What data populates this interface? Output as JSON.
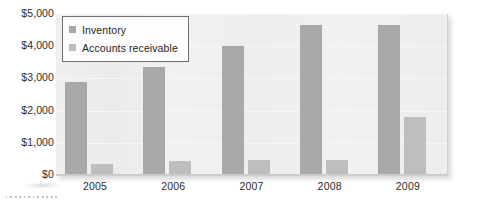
{
  "chart_data": {
    "type": "bar",
    "title": "",
    "xlabel": "",
    "ylabel": "",
    "categories": [
      "2005",
      "2006",
      "2007",
      "2008",
      "2009"
    ],
    "series": [
      {
        "name": "Inventory",
        "color": "#a8a8a8",
        "values": [
          2900,
          3350,
          4000,
          4650,
          4650
        ]
      },
      {
        "name": "Accounts receivable",
        "color": "#bebebe",
        "values": [
          350,
          430,
          480,
          470,
          1800
        ]
      }
    ],
    "ylim": [
      0,
      5000
    ],
    "yticks": [
      0,
      1000,
      2000,
      3000,
      4000,
      5000
    ],
    "ytick_labels": [
      "$0",
      "$1,000",
      "$2,000",
      "$3,000",
      "$4,000",
      "$5,000"
    ],
    "grid": true,
    "legend_position": "top-left"
  },
  "legend": {
    "entries": [
      {
        "label": "Inventory",
        "swatch": "legend-swatch-inventory"
      },
      {
        "label": "Accounts receivable",
        "swatch": "legend-swatch-receivable"
      }
    ]
  }
}
